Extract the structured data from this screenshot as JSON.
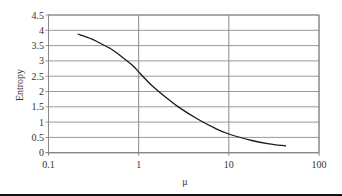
{
  "chart_data": {
    "type": "line",
    "title": "",
    "xlabel": "μ",
    "ylabel": "Entropy",
    "xscale": "log",
    "xlim": [
      0.1,
      100
    ],
    "ylim": [
      0,
      4.5
    ],
    "grid": true,
    "legend": null,
    "x_ticks": [
      "0.1",
      "1",
      "10",
      "100"
    ],
    "y_ticks": [
      "0",
      "0.5",
      "1",
      "1.5",
      "2",
      "2.5",
      "3",
      "3.5",
      "4",
      "4.5"
    ],
    "series": [
      {
        "name": "Entropy",
        "x": [
          0.21,
          0.3,
          0.36,
          0.5,
          0.67,
          0.88,
          1.0,
          1.4,
          2.15,
          2.8,
          4.5,
          7.0,
          10.0,
          18.0,
          28.0,
          43.0
        ],
        "values": [
          3.88,
          3.72,
          3.6,
          3.38,
          3.1,
          2.82,
          2.64,
          2.2,
          1.74,
          1.48,
          1.1,
          0.8,
          0.61,
          0.4,
          0.29,
          0.22
        ]
      }
    ]
  }
}
